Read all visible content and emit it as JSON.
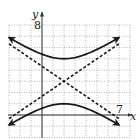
{
  "chart_data": {
    "type": "line",
    "title": "",
    "xlabel": "x",
    "ylabel": "y",
    "tick_labels": {
      "y_top": "8",
      "x_right": "7"
    },
    "xlim": [
      -3,
      8
    ],
    "ylim": [
      -2,
      8
    ],
    "grid": true,
    "grid_style": "dotted",
    "equation": "(y-3)^2/4 - (x-2)^2/9 = 1",
    "center": [
      2,
      3
    ],
    "vertices": [
      [
        2,
        5
      ],
      [
        2,
        1
      ]
    ],
    "series": [
      {
        "name": "upper branch",
        "style": "solid",
        "points": [
          [
            -3,
            7.4
          ],
          [
            -1,
            5.8
          ],
          [
            0,
            5.4
          ],
          [
            1,
            5.1
          ],
          [
            2,
            5
          ],
          [
            3,
            5.1
          ],
          [
            4,
            5.4
          ],
          [
            5,
            5.8
          ],
          [
            7,
            7.4
          ]
        ]
      },
      {
        "name": "lower branch",
        "style": "solid",
        "points": [
          [
            -3,
            -1.4
          ],
          [
            -1,
            0.2
          ],
          [
            0,
            0.6
          ],
          [
            1,
            0.9
          ],
          [
            2,
            1
          ],
          [
            3,
            0.9
          ],
          [
            4,
            0.6
          ],
          [
            5,
            0.2
          ],
          [
            7,
            -1.4
          ]
        ]
      },
      {
        "name": "asymptote 1",
        "style": "dashed",
        "equation": "y = 3 + (2/3)(x-2)",
        "points": [
          [
            -3,
            -0.33
          ],
          [
            7,
            6.33
          ]
        ]
      },
      {
        "name": "asymptote 2",
        "style": "dashed",
        "equation": "y = 3 - (2/3)(x-2)",
        "points": [
          [
            -3,
            6.33
          ],
          [
            7,
            -0.33
          ]
        ]
      }
    ]
  },
  "labels": {
    "y_axis": "y",
    "x_axis": "x",
    "y_tick": "8",
    "x_tick": "7"
  },
  "colors": {
    "curve": "#1a1a1a",
    "grid": "#9a9a9a",
    "axis": "#333333"
  }
}
